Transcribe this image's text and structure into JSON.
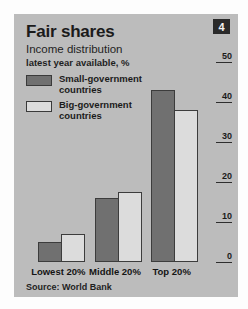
{
  "badge": {
    "number": "4"
  },
  "header": {
    "title": "Fair shares",
    "subtitle": "Income distribution",
    "subtitle2": "latest year available, %"
  },
  "legend": {
    "items": [
      {
        "label": "Small-government\ncountries",
        "swatch": "#707070",
        "key": "small-gov"
      },
      {
        "label": "Big-government\ncountries",
        "swatch": "#dcdcdc",
        "key": "big-gov"
      }
    ]
  },
  "source": {
    "text": "Source: World Bank"
  },
  "colors": {
    "panel_background": "#bcbcbc",
    "small_gov_bar": "#707070",
    "big_gov_bar": "#dcdcdc",
    "bar_outline": "#3c3c3c",
    "badge_background": "#2a2a2a",
    "text": "#1b1b1b"
  },
  "chart_data": {
    "type": "bar",
    "title": "Fair shares",
    "subtitle": "Income distribution, latest year available, %",
    "xlabel": "",
    "ylabel": "%",
    "ylim": [
      0,
      50
    ],
    "yticks": [
      "0",
      "10",
      "20",
      "30",
      "40",
      "50"
    ],
    "grid": false,
    "legend_position": "top-left",
    "axis_position": "right",
    "categories": [
      "Lowest 20%",
      "Middle 20%",
      "Top 20%"
    ],
    "series": [
      {
        "name": "Small-government countries",
        "values": [
          5,
          16,
          43
        ]
      },
      {
        "name": "Big-government countries",
        "values": [
          7,
          17.5,
          38
        ]
      }
    ],
    "source": "Source: World Bank"
  }
}
